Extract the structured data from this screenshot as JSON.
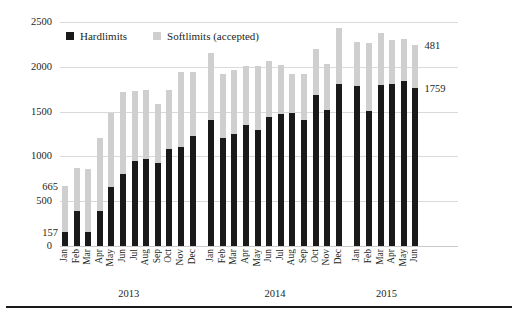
{
  "chart_data": {
    "type": "bar",
    "subtype": "stacked-vertical",
    "title": "",
    "subtitle": "",
    "xlabel": "",
    "ylabel": "",
    "ylim": [
      0,
      2500
    ],
    "yticks": [
      0,
      500,
      1000,
      1500,
      2000,
      2500
    ],
    "grid": true,
    "legend_position": "top-left-inside",
    "categories": [
      "Jan",
      "Feb",
      "Mar",
      "Apr",
      "May",
      "Jun",
      "Jul",
      "Aug",
      "Sep",
      "Oct",
      "Nov",
      "Dec",
      "Jan",
      "Feb",
      "Mar",
      "Apr",
      "May",
      "Jun",
      "Jul",
      "Aug",
      "Sep",
      "Oct",
      "Nov",
      "Dec",
      "Jan",
      "Feb",
      "Mar",
      "Apr",
      "May",
      "Jun"
    ],
    "groups": [
      {
        "label": "2013",
        "start": 0,
        "count": 12
      },
      {
        "label": "2014",
        "start": 12,
        "count": 12
      },
      {
        "label": "2015",
        "start": 24,
        "count": 6
      }
    ],
    "series": [
      {
        "name": "Hardlimits",
        "color": "#1a1a1a",
        "values": [
          157,
          390,
          160,
          390,
          660,
          800,
          950,
          975,
          930,
          1080,
          1105,
          1230,
          1410,
          1205,
          1250,
          1355,
          1290,
          1440,
          1470,
          1485,
          1405,
          1690,
          1520,
          1810,
          1785,
          1505,
          1800,
          1805,
          1840,
          1759
        ]
      },
      {
        "name": "Softlimits (accepted)",
        "color": "#cfcfcf",
        "values": [
          508,
          480,
          700,
          815,
          830,
          920,
          775,
          765,
          650,
          660,
          835,
          715,
          740,
          715,
          710,
          650,
          715,
          625,
          545,
          440,
          520,
          505,
          515,
          620,
          495,
          760,
          575,
          490,
          470,
          481
        ]
      }
    ],
    "totals": [
      665,
      870,
      860,
      1205,
      1490,
      1720,
      1725,
      1740,
      1580,
      1740,
      1940,
      1945,
      2150,
      1920,
      1960,
      2005,
      2005,
      2065,
      2015,
      1925,
      1925,
      2195,
      2035,
      2430,
      2280,
      2265,
      2375,
      2295,
      2310,
      2240
    ],
    "annotations": [
      {
        "text": "665",
        "series": "total",
        "category_index": 0,
        "side": "left"
      },
      {
        "text": "157",
        "series": "Hardlimits",
        "category_index": 0,
        "side": "left"
      },
      {
        "text": "481",
        "series": "total",
        "category_index": 29,
        "side": "right"
      },
      {
        "text": "1759",
        "series": "Hardlimits",
        "category_index": 29,
        "side": "right"
      }
    ]
  },
  "legend": {
    "items": [
      {
        "label": "Hardlimits",
        "swatch": "hard"
      },
      {
        "label": "Softlimits (accepted)",
        "swatch": "soft"
      }
    ]
  },
  "axis": {
    "y_tick_labels": [
      "2500",
      "2000",
      "1500",
      "1000",
      "500",
      "0"
    ]
  },
  "colors": {
    "hardlimits": "#1a1a1a",
    "softlimits": "#cfcfcf",
    "gridline": "#d9d9d9",
    "text": "#231f20",
    "background": "#ffffff",
    "rule": "#1a1a1a"
  }
}
